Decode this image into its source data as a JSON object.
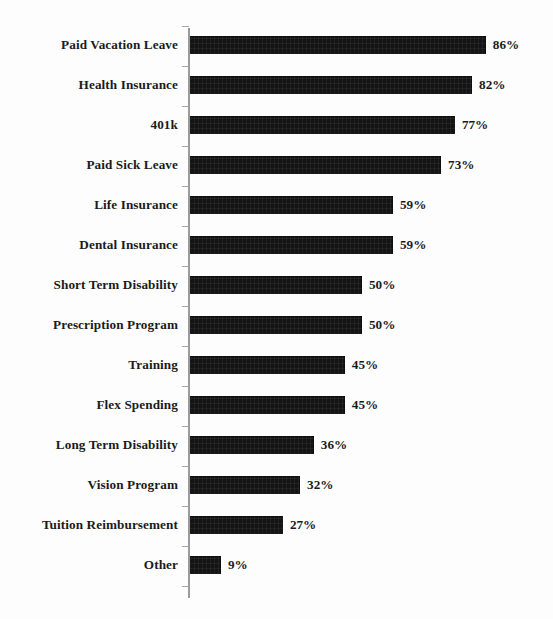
{
  "chart_data": {
    "type": "bar",
    "orientation": "horizontal",
    "title": "",
    "xlabel": "",
    "ylabel": "",
    "xlim": [
      0,
      100
    ],
    "grid": false,
    "legend": false,
    "value_suffix": "%",
    "categories": [
      "Paid Vacation Leave",
      "Health Insurance",
      "401k",
      "Paid Sick Leave",
      "Life Insurance",
      "Dental Insurance",
      "Short Term Disability",
      "Prescription Program",
      "Training",
      "Flex Spending",
      "Long Term Disability",
      "Vision Program",
      "Tuition Reimbursement",
      "Other"
    ],
    "values": [
      86,
      82,
      77,
      73,
      59,
      59,
      50,
      50,
      45,
      45,
      36,
      32,
      27,
      9
    ],
    "data_labels": [
      "86%",
      "82%",
      "77%",
      "73%",
      "59%",
      "59%",
      "50%",
      "50%",
      "45%",
      "45%",
      "36%",
      "32%",
      "27%",
      "9%"
    ],
    "bar_color": "#141414",
    "axis_color": "#9a9a9a",
    "label_color": "#1b1b1b",
    "background_color": "#fdfdfd"
  }
}
